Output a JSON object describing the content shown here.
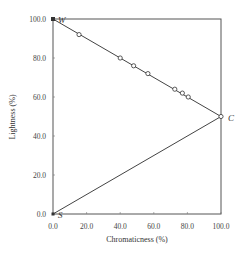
{
  "chart_data": {
    "type": "line",
    "title": "",
    "xlabel": "Chromaticness (%)",
    "ylabel": "Lightness (%)",
    "xlim": [
      0,
      100
    ],
    "ylim": [
      0,
      100
    ],
    "x_ticks": [
      "0.0",
      "20.0",
      "40.0",
      "60.0",
      "80.0",
      "100.0"
    ],
    "y_ticks": [
      "0.0",
      "20.0",
      "40.0",
      "60.0",
      "80.0",
      "100.0"
    ],
    "grid": false,
    "legend": null,
    "vertices": [
      {
        "label": "W",
        "x": 0,
        "y": 100
      },
      {
        "label": "C",
        "x": 100,
        "y": 50
      },
      {
        "label": "S",
        "x": 0,
        "y": 0
      }
    ],
    "series": [
      {
        "name": "W-C line (samples)",
        "marker": "open-circle",
        "points": [
          {
            "x": 15.5,
            "y": 92.0
          },
          {
            "x": 40.0,
            "y": 80.0
          },
          {
            "x": 48.0,
            "y": 76.0
          },
          {
            "x": 56.5,
            "y": 72.0
          },
          {
            "x": 72.5,
            "y": 64.0
          },
          {
            "x": 77.0,
            "y": 62.0
          },
          {
            "x": 80.5,
            "y": 60.0
          },
          {
            "x": 100.0,
            "y": 50.0
          }
        ]
      },
      {
        "name": "S-C line",
        "marker": "none",
        "points": [
          {
            "x": 0,
            "y": 0
          },
          {
            "x": 100,
            "y": 50
          }
        ]
      }
    ]
  }
}
